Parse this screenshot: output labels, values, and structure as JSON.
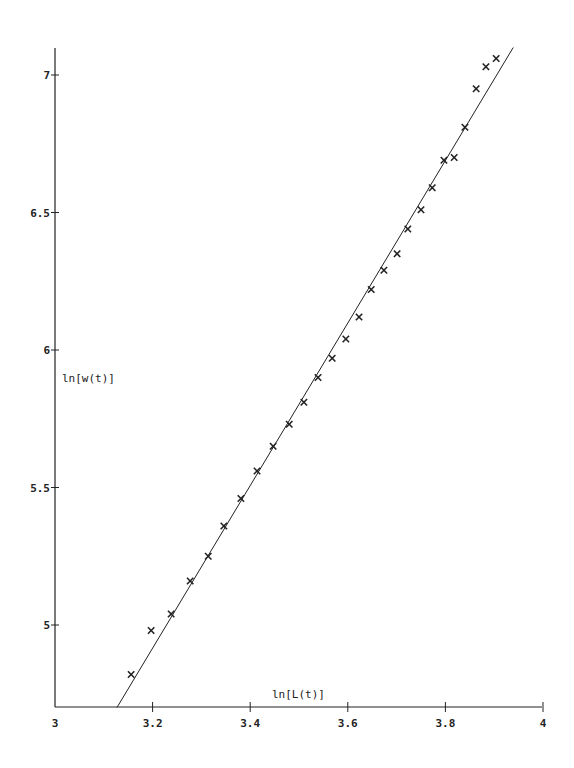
{
  "chart_data": {
    "type": "scatter",
    "title": "",
    "xlabel": "ln[L(t)]",
    "ylabel": "ln[w(t)]",
    "xlim": [
      3,
      4
    ],
    "ylim": [
      4.7,
      7.15
    ],
    "xticks": [
      3,
      3.2,
      3.4,
      3.6,
      3.8,
      4
    ],
    "xtick_labels": [
      "3",
      "3.2",
      "3.4",
      "3.6",
      "3.8",
      "4"
    ],
    "yticks": [
      5,
      5.5,
      6,
      6.5,
      7
    ],
    "ytick_labels": [
      "5",
      "5.5",
      "6",
      "6.5",
      "7"
    ],
    "grid": false,
    "legend": null,
    "series": [
      {
        "name": "data",
        "marker": "x",
        "points": [
          [
            3.156,
            4.82
          ],
          [
            3.197,
            4.98
          ],
          [
            3.238,
            5.04
          ],
          [
            3.277,
            5.16
          ],
          [
            3.314,
            5.25
          ],
          [
            3.346,
            5.36
          ],
          [
            3.381,
            5.46
          ],
          [
            3.414,
            5.56
          ],
          [
            3.447,
            5.65
          ],
          [
            3.48,
            5.73
          ],
          [
            3.51,
            5.81
          ],
          [
            3.539,
            5.9
          ],
          [
            3.568,
            5.97
          ],
          [
            3.596,
            6.04
          ],
          [
            3.623,
            6.12
          ],
          [
            3.648,
            6.22
          ],
          [
            3.674,
            6.29
          ],
          [
            3.701,
            6.35
          ],
          [
            3.723,
            6.44
          ],
          [
            3.75,
            6.51
          ],
          [
            3.773,
            6.59
          ],
          [
            3.797,
            6.69
          ],
          [
            3.818,
            6.7
          ],
          [
            3.84,
            6.81
          ],
          [
            3.863,
            6.95
          ],
          [
            3.883,
            7.03
          ],
          [
            3.904,
            7.06
          ]
        ]
      },
      {
        "name": "fit",
        "type": "line",
        "points": [
          [
            3.127,
            4.7
          ],
          [
            3.939,
            7.1
          ]
        ]
      }
    ]
  },
  "colors": {
    "ink": "#222222",
    "background": "#ffffff"
  }
}
